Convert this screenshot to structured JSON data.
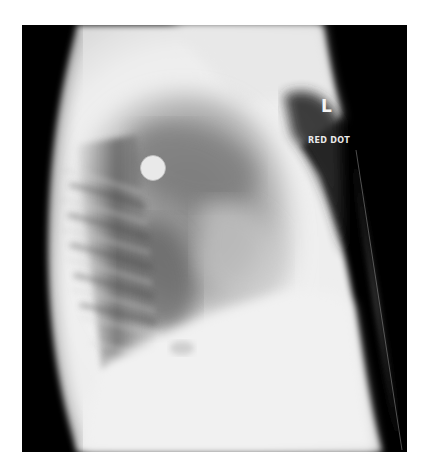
{
  "image": {
    "kind": "lateral chest radiograph",
    "side_marker": "L",
    "marker_caption": "RED DOT"
  },
  "colors": {
    "background": "#ffffff",
    "film_black": "#000000",
    "soft_tissue": "#f2f2f2",
    "lung_field": "#7a7a7a",
    "marker_text": "#f4f4f4"
  }
}
